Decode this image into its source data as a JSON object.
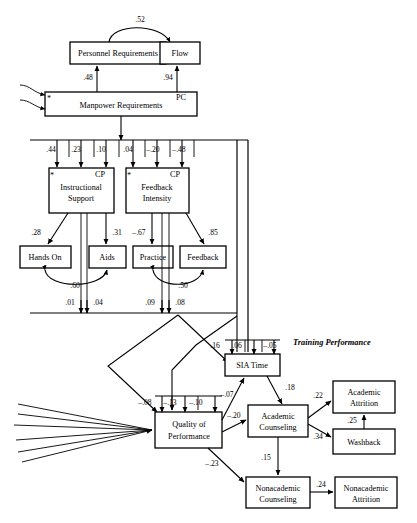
{
  "figure": {
    "type": "path-diagram",
    "section_label": "Training Performance",
    "marker_star": "*",
    "marker_cp": "CP",
    "marker_pc": "PC"
  },
  "nodes": {
    "personnel_requirements": "Personnel Requirements",
    "flow": "Flow",
    "manpower_requirements": "Manpower Requirements",
    "instructional_support_l1": "Instructional",
    "instructional_support_l2": "Support",
    "feedback_intensity_l1": "Feedback",
    "feedback_intensity_l2": "Intensity",
    "hands_on": "Hands On",
    "aids": "Aids",
    "practice": "Practice",
    "feedback": "Feedback",
    "sia_time": "SIA Time",
    "quality_of_performance_l1": "Quality of",
    "quality_of_performance_l2": "Performance",
    "academic_counseling_l1": "Academic",
    "academic_counseling_l2": "Counseling",
    "nonacademic_counseling_l1": "Nonacademic",
    "nonacademic_counseling_l2": "Counseling",
    "academic_attrition_l1": "Academic",
    "academic_attrition_l2": "Attrition",
    "nonacademic_attrition_l1": "Nonacademic",
    "nonacademic_attrition_l2": "Attrition",
    "washback": "Washback"
  },
  "coefficients": {
    "flow_personnel_corr": ".52",
    "manpower_to_personnel": ".48",
    "manpower_to_flow": ".94",
    "bus1_c1": ".44",
    "bus1_c2": ".23",
    "bus1_c3": ".10",
    "bus1_c4": ".04",
    "bus1_c5": "–.20",
    "bus1_c6": "–.48",
    "instr_to_hands_on": ".28",
    "instr_to_aids": ".31",
    "feedint_to_practice": "–.67",
    "feedint_to_feedback": ".85",
    "hands_aids_corr": ".60",
    "practice_feedback_corr": ".50",
    "bus2_c1": ".01",
    "bus2_c2": ".04",
    "bus2_c3": ".09",
    "bus2_c4": ".08",
    "sia_in_1": ".16",
    "sia_in_2": ".06",
    "sia_in_3": "–.05",
    "qop_in_1": "–.08",
    "qop_in_2": "–.13",
    "qop_in_3": "–.10",
    "qop_to_sia": "–.07",
    "sia_to_academic_counseling": ".18",
    "qop_to_academic_counseling": "–.20",
    "qop_to_nonacademic_counseling": "–.23",
    "academic_counseling_to_nonacademic": ".15",
    "academic_counseling_to_attrition": ".22",
    "academic_counseling_to_washback": ".34",
    "washback_to_attrition": ".25",
    "nonacademic_counseling_to_attrition": ".24"
  }
}
